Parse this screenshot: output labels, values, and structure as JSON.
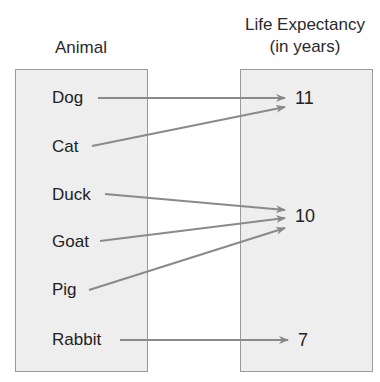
{
  "headers": {
    "domain": "Animal",
    "range_line1": "Life Expectancy",
    "range_line2": "(in years)"
  },
  "animals": [
    "Dog",
    "Cat",
    "Duck",
    "Goat",
    "Pig",
    "Rabbit"
  ],
  "values": [
    "11",
    "10",
    "7"
  ],
  "mappings": [
    {
      "from": "Dog",
      "to": "11"
    },
    {
      "from": "Cat",
      "to": "11"
    },
    {
      "from": "Duck",
      "to": "10"
    },
    {
      "from": "Goat",
      "to": "10"
    },
    {
      "from": "Pig",
      "to": "10"
    },
    {
      "from": "Rabbit",
      "to": "7"
    }
  ],
  "colors": {
    "box_fill": "#eeeeee",
    "box_border": "#9a9a9a",
    "arrow": "#888888"
  }
}
